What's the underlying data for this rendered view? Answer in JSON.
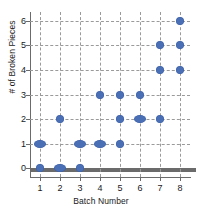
{
  "chart_data": {
    "type": "scatter",
    "title": "",
    "xlabel": "Batch Number",
    "ylabel": "# of Broken Pieces",
    "xlim": [
      0.5,
      8.5
    ],
    "ylim": [
      -0.35,
      6.35
    ],
    "xticks": [
      "1",
      "2",
      "3",
      "4",
      "5",
      "6",
      "7",
      "8"
    ],
    "yticks": [
      "0",
      "1",
      "2",
      "3",
      "4",
      "5",
      "6"
    ],
    "grid": "both-dashed",
    "legend": "none",
    "marker_color": "#4a6fb5",
    "marker_edge_color": "#3a5ea6",
    "points": [
      {
        "x": 1,
        "y": 0,
        "wide": false
      },
      {
        "x": 1,
        "y": 1,
        "wide": true
      },
      {
        "x": 2,
        "y": 0,
        "wide": true
      },
      {
        "x": 2,
        "y": 2,
        "wide": false
      },
      {
        "x": 3,
        "y": 0,
        "wide": false
      },
      {
        "x": 3,
        "y": 1,
        "wide": true
      },
      {
        "x": 4,
        "y": 1,
        "wide": true
      },
      {
        "x": 4,
        "y": 3,
        "wide": false
      },
      {
        "x": 5,
        "y": 1,
        "wide": false
      },
      {
        "x": 5,
        "y": 2,
        "wide": false
      },
      {
        "x": 5,
        "y": 3,
        "wide": false
      },
      {
        "x": 6,
        "y": 2,
        "wide": true
      },
      {
        "x": 6,
        "y": 3,
        "wide": false
      },
      {
        "x": 7,
        "y": 2,
        "wide": false
      },
      {
        "x": 7,
        "y": 4,
        "wide": false
      },
      {
        "x": 7,
        "y": 5,
        "wide": false
      },
      {
        "x": 8,
        "y": 4,
        "wide": false
      },
      {
        "x": 8,
        "y": 5,
        "wide": false
      },
      {
        "x": 8,
        "y": 6,
        "wide": false
      }
    ]
  }
}
